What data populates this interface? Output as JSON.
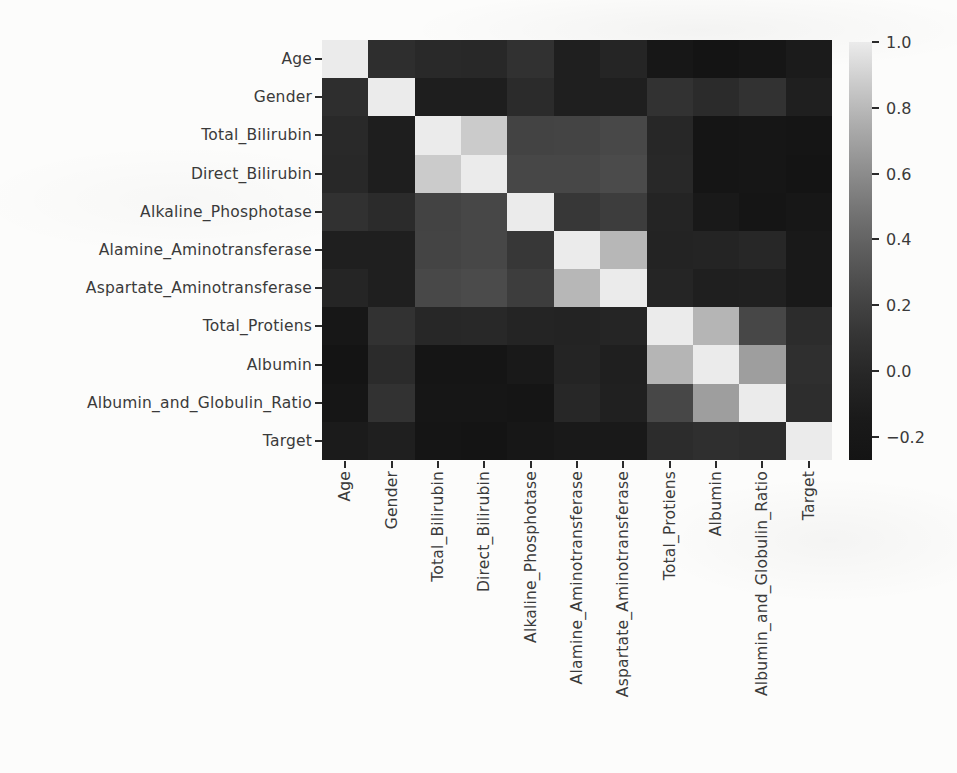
{
  "page": {
    "background": "#fcfcfb",
    "axis_text_color": "#3a3a3a"
  },
  "chart_data": {
    "type": "heatmap",
    "title": "",
    "xlabel": "",
    "ylabel": "",
    "grid": false,
    "colormap": "gray",
    "legend_position": "right-colorbar",
    "labels": [
      "Age",
      "Gender",
      "Total_Bilirubin",
      "Direct_Bilirubin",
      "Alkaline_Phosphotase",
      "Alamine_Aminotransferase",
      "Aspartate_Aminotransferase",
      "Total_Protiens",
      "Albumin",
      "Albumin_and_Globulin_Ratio",
      "Target"
    ],
    "matrix": [
      [
        1.0,
        0.057,
        0.012,
        0.007,
        0.08,
        -0.087,
        -0.02,
        -0.187,
        -0.266,
        -0.216,
        -0.137
      ],
      [
        0.057,
        1.0,
        -0.089,
        -0.1,
        0.027,
        -0.082,
        -0.08,
        0.089,
        0.03,
        0.09,
        -0.08
      ],
      [
        0.012,
        -0.089,
        1.0,
        0.875,
        0.206,
        0.214,
        0.238,
        -0.008,
        -0.222,
        -0.206,
        -0.22
      ],
      [
        0.007,
        -0.1,
        0.875,
        1.0,
        0.235,
        0.234,
        0.257,
        0.0,
        -0.228,
        -0.2,
        -0.246
      ],
      [
        0.08,
        0.027,
        0.206,
        0.235,
        1.0,
        0.126,
        0.167,
        -0.029,
        -0.165,
        -0.234,
        -0.184
      ],
      [
        -0.087,
        -0.082,
        0.214,
        0.234,
        0.126,
        1.0,
        0.792,
        -0.042,
        -0.03,
        -0.002,
        -0.163
      ],
      [
        -0.02,
        -0.08,
        0.238,
        0.257,
        0.167,
        0.792,
        1.0,
        -0.025,
        -0.085,
        -0.07,
        -0.152
      ],
      [
        -0.187,
        0.089,
        -0.008,
        0.0,
        -0.029,
        -0.042,
        -0.025,
        1.0,
        0.784,
        0.234,
        0.035
      ],
      [
        -0.266,
        0.03,
        -0.222,
        -0.228,
        -0.165,
        -0.03,
        -0.085,
        0.784,
        1.0,
        0.686,
        0.06
      ],
      [
        -0.216,
        0.09,
        -0.206,
        -0.2,
        -0.234,
        -0.002,
        -0.07,
        0.234,
        0.686,
        1.0,
        0.05
      ],
      [
        -0.137,
        -0.08,
        -0.22,
        -0.246,
        -0.184,
        -0.163,
        -0.152,
        0.035,
        0.06,
        0.05,
        1.0
      ]
    ],
    "vmin": -0.27,
    "vmax": 1.0,
    "colorbar": {
      "tick_labels": [
        "1.0",
        "0.8",
        "0.6",
        "0.4",
        "0.2",
        "0.0",
        "−0.2"
      ],
      "tick_values": [
        1.0,
        0.8,
        0.6,
        0.4,
        0.2,
        0.0,
        -0.2
      ],
      "min_color": "#161616",
      "max_color": "#ebebeb"
    }
  }
}
